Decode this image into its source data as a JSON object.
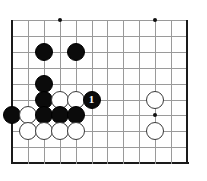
{
  "diagram": {
    "kind": "go-board-diagram",
    "board": {
      "origin_x": 12,
      "origin_y": 20,
      "spacing": 15.9,
      "cols": 12,
      "rows": 10,
      "line_color": "#9a9a9a",
      "edge_color": "#1a1a1a",
      "background": "#ffffff",
      "edges": [
        "left",
        "bottom",
        "right"
      ]
    },
    "star_points": [
      {
        "col": 3,
        "row": 0
      },
      {
        "col": 9,
        "row": 0
      },
      {
        "col": 9,
        "row": 6
      }
    ],
    "stones": [
      {
        "col": 2,
        "row": 2,
        "color": "black",
        "label": ""
      },
      {
        "col": 4,
        "row": 2,
        "color": "black",
        "label": ""
      },
      {
        "col": 2,
        "row": 4,
        "color": "black",
        "label": ""
      },
      {
        "col": 2,
        "row": 5,
        "color": "black",
        "label": ""
      },
      {
        "col": 3,
        "row": 5,
        "color": "white",
        "label": ""
      },
      {
        "col": 4,
        "row": 5,
        "color": "white",
        "label": ""
      },
      {
        "col": 5,
        "row": 5,
        "color": "black",
        "label": "1"
      },
      {
        "col": 9,
        "row": 5,
        "color": "white",
        "label": ""
      },
      {
        "col": 0,
        "row": 6,
        "color": "black",
        "label": ""
      },
      {
        "col": 1,
        "row": 6,
        "color": "white",
        "label": ""
      },
      {
        "col": 2,
        "row": 6,
        "color": "black",
        "label": ""
      },
      {
        "col": 3,
        "row": 6,
        "color": "black",
        "label": ""
      },
      {
        "col": 4,
        "row": 6,
        "color": "black",
        "label": ""
      },
      {
        "col": 1,
        "row": 7,
        "color": "white",
        "label": ""
      },
      {
        "col": 2,
        "row": 7,
        "color": "white",
        "label": ""
      },
      {
        "col": 3,
        "row": 7,
        "color": "white",
        "label": ""
      },
      {
        "col": 4,
        "row": 7,
        "color": "white",
        "label": ""
      },
      {
        "col": 9,
        "row": 7,
        "color": "white",
        "label": ""
      }
    ],
    "move_numbers": [
      "1"
    ]
  }
}
